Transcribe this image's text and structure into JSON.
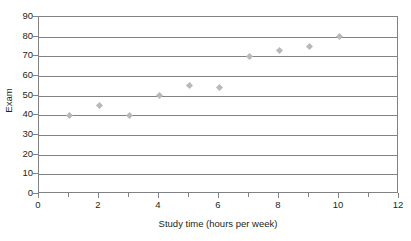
{
  "chart_data": {
    "type": "scatter",
    "title": "",
    "xlabel": "Study time (hours per week)",
    "ylabel": "Exam",
    "xlim": [
      0,
      12
    ],
    "ylim": [
      0,
      90
    ],
    "grid": true,
    "legend": null,
    "x_ticks": [
      0,
      2,
      4,
      6,
      8,
      10,
      12
    ],
    "x_minor_ticks": [
      1,
      3,
      5,
      7,
      9,
      11
    ],
    "y_ticks": [
      0,
      10,
      20,
      30,
      40,
      50,
      60,
      70,
      80,
      90
    ],
    "marker_color": "#b7b9bb",
    "axis_color": "#808285",
    "x": [
      1,
      2,
      3,
      4,
      5,
      6,
      7,
      8,
      9,
      10
    ],
    "y": [
      40,
      45,
      40,
      50,
      55,
      54,
      70,
      73,
      75,
      80
    ],
    "points": [
      {
        "x": 1,
        "y": 40
      },
      {
        "x": 2,
        "y": 45
      },
      {
        "x": 3,
        "y": 40
      },
      {
        "x": 4,
        "y": 50
      },
      {
        "x": 5,
        "y": 55
      },
      {
        "x": 6,
        "y": 54
      },
      {
        "x": 7,
        "y": 70
      },
      {
        "x": 8,
        "y": 73
      },
      {
        "x": 9,
        "y": 75
      },
      {
        "x": 10,
        "y": 80
      }
    ]
  },
  "labels": {
    "y_axis_title": "Exam",
    "x_axis_title": "Study time (hours per week)",
    "title_remnant": ""
  }
}
